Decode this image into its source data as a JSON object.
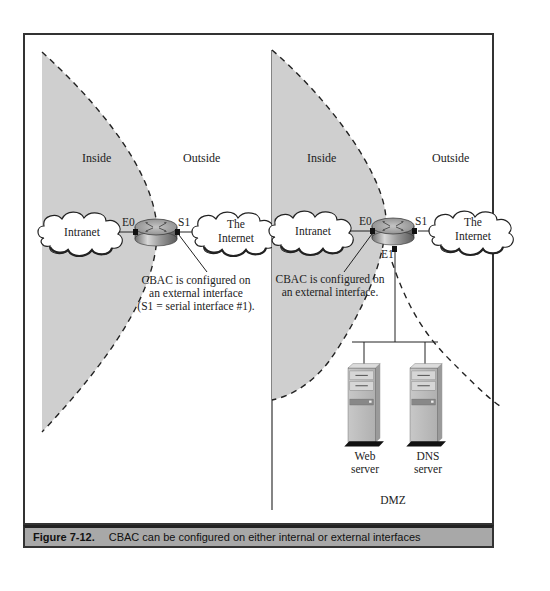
{
  "figure": {
    "caption_label": "Figure 7-12.",
    "caption_text": "CBAC can be configured on either internal or external interfaces"
  },
  "left_panel": {
    "zone_inside": "Inside",
    "zone_outside": "Outside",
    "intranet_cloud": "Intranet",
    "internet_cloud_line1": "The",
    "internet_cloud_line2": "Internet",
    "router_port_e0": "E0",
    "router_port_s1": "S1",
    "callout_line1": "CBAC is configured on",
    "callout_line2": "an external interface",
    "callout_line3": "(S1 = serial interface #1)."
  },
  "right_panel": {
    "zone_inside": "Inside",
    "zone_outside": "Outside",
    "zone_dmz": "DMZ",
    "intranet_cloud": "Intranet",
    "internet_cloud_line1": "The",
    "internet_cloud_line2": "Internet",
    "router_port_e0": "E0",
    "router_port_s1": "S1",
    "router_port_e1": "E1",
    "callout_line1": "CBAC is configured on",
    "callout_line2": "an external interface.",
    "web_server_line1": "Web",
    "web_server_line2": "server",
    "dns_server_line1": "DNS",
    "dns_server_line2": "server"
  },
  "colors": {
    "inside_shade": "#cfcfcf",
    "caption_bg": "#a8a8a8",
    "border": "#333333"
  }
}
